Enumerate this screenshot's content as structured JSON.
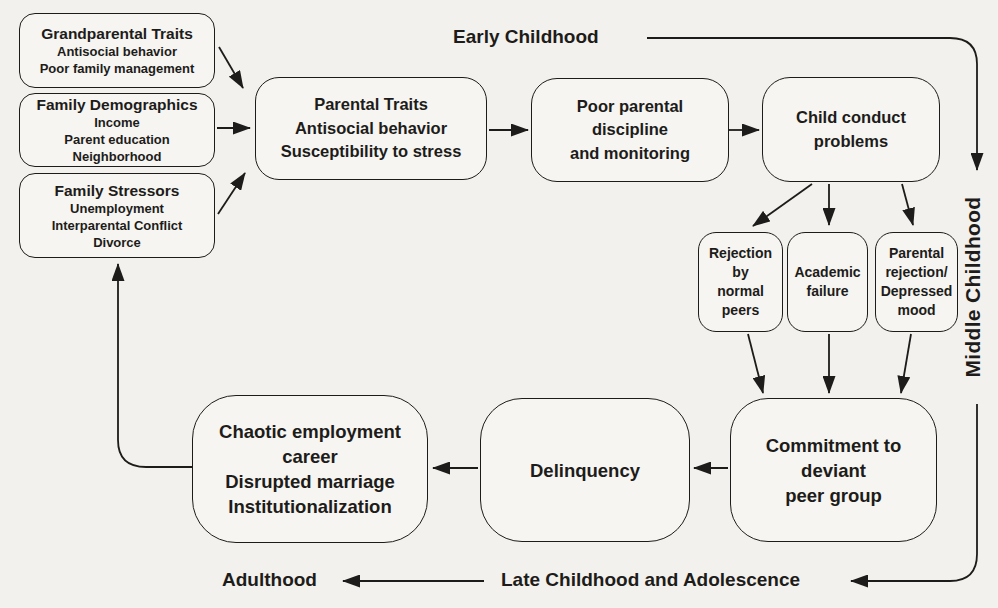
{
  "theme": {
    "background": "#f3f1ed",
    "ink": "#1d1c1a",
    "node_fill": "#f6f5f1"
  },
  "stages": {
    "early_childhood": "Early Childhood",
    "middle_childhood": "Middle Childhood",
    "late_childhood_adolescence": "Late Childhood and Adolescence",
    "adulthood": "Adulthood"
  },
  "boxes": {
    "grandparental_traits": {
      "title": "Grandparental Traits",
      "lines": [
        "Antisocial behavior",
        "Poor family management"
      ]
    },
    "family_demographics": {
      "title": "Family Demographics",
      "lines": [
        "Income",
        "Parent education",
        "Neighborhood"
      ]
    },
    "family_stressors": {
      "title": "Family Stressors",
      "lines": [
        "Unemployment",
        "Interparental Conflict",
        "Divorce"
      ]
    },
    "parental_traits": {
      "lines": [
        "Parental Traits",
        "Antisocial behavior",
        "Susceptibility to stress"
      ]
    },
    "poor_parental_discipline": {
      "lines": [
        "Poor parental",
        "discipline",
        "and monitoring"
      ]
    },
    "child_conduct_problems": {
      "lines": [
        "Child conduct",
        "problems"
      ]
    },
    "rejection_by_normal_peers": {
      "lines": [
        "Rejection",
        "by",
        "normal",
        "peers"
      ]
    },
    "academic_failure": {
      "lines": [
        "Academic",
        "failure"
      ]
    },
    "parental_rejection_depressed_mood": {
      "lines": [
        "Parental",
        "rejection/",
        "Depressed",
        "mood"
      ]
    },
    "commitment_deviant_peer_group": {
      "lines": [
        "Commitment to",
        "deviant",
        "peer group"
      ]
    },
    "delinquency": {
      "lines": [
        "Delinquency"
      ]
    },
    "chaotic_employment": {
      "lines": [
        "Chaotic employment",
        "career",
        "Disrupted marriage",
        "Institutionalization"
      ]
    }
  }
}
